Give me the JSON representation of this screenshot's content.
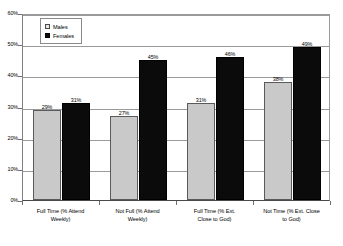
{
  "chart_data": {
    "type": "bar",
    "title": "",
    "subtitle": "",
    "xlabel": "",
    "ylabel": "",
    "ylim": [
      0,
      60
    ],
    "ytick_step": 10,
    "ytick_labels": [
      "0%",
      "10%",
      "20%",
      "30%",
      "40%",
      "50%",
      "60%"
    ],
    "ytick_values": [
      0,
      10,
      20,
      30,
      40,
      50,
      60
    ],
    "grid": true,
    "legend_position": "top-left-inside",
    "value_suffix": "%",
    "categories": [
      "Full Time (% Attend Weekly)",
      "Not Full (% Attend Weekly)",
      "Full Time (% Ext. Close to God)",
      "Not Time (% Ext. Close to God)"
    ],
    "category_lines": [
      [
        "Full Time (% Attend",
        "Weekly)"
      ],
      [
        "Not Full (% Attend",
        "Weekly)"
      ],
      [
        "Full Time (% Ext.",
        "Close to God)"
      ],
      [
        "Not Time (% Ext. Close",
        "to God)"
      ]
    ],
    "series": [
      {
        "name": "Males",
        "color": "#c9c9c9",
        "values": [
          29,
          27,
          31,
          38
        ],
        "labels": [
          "29%",
          "27%",
          "31%",
          "38%"
        ]
      },
      {
        "name": "Females",
        "color": "#0b0b0b",
        "values": [
          31,
          45,
          46,
          49
        ],
        "labels": [
          "31%",
          "45%",
          "46%",
          "49%"
        ]
      }
    ]
  },
  "legend": {
    "items": [
      {
        "label": "Males"
      },
      {
        "label": "Females"
      }
    ]
  }
}
